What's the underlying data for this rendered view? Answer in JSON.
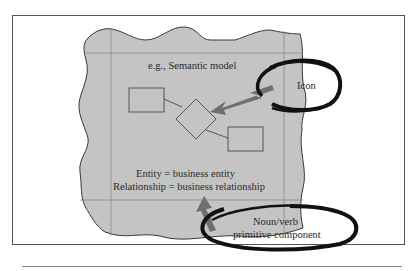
{
  "figure": {
    "region_label": "e.g., Semantic model",
    "definition_lines": [
      "Entity = business entity",
      "Relationship = business relationship"
    ],
    "callouts": [
      {
        "id": "icon",
        "label": "Icon"
      },
      {
        "id": "noun-verb",
        "label_lines": [
          "Noun/verb",
          "primitive component"
        ]
      }
    ],
    "entities": [
      "entity-box-1",
      "relationship-diamond",
      "entity-box-2"
    ]
  },
  "colors": {
    "region_fill": "#c4c4c4",
    "outline": "#555555",
    "arrow": "#6f6f6f",
    "callout_ring": "#111111",
    "background": "#ffffff"
  }
}
